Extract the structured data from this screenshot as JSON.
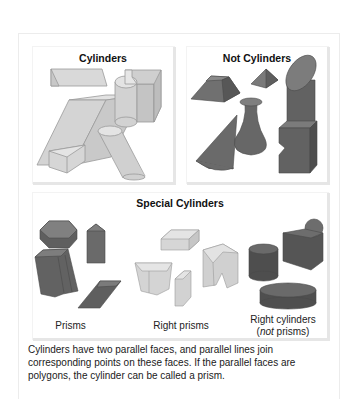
{
  "panels": {
    "cylinders": {
      "title": "Cylinders",
      "fill_color": "#d8d8d8",
      "stroke_color": "#9a9a9a"
    },
    "not_cylinders": {
      "title": "Not Cylinders",
      "fill_color": "#6b6b6b",
      "stroke_color": "#3e3e3e"
    },
    "special_cylinders": {
      "title": "Special Cylinders",
      "groups": [
        {
          "label": "Prisms"
        },
        {
          "label": "Right prisms"
        },
        {
          "label_line1": "Right cylinders",
          "label_line2_italic": "not",
          "label_line2_rest": " prisms)",
          "label_line2_open": "("
        }
      ]
    }
  },
  "caption": "Cylinders have two parallel faces, and parallel lines join corresponding points on these faces. If the parallel faces are polygons, the cylinder can be called a prism."
}
